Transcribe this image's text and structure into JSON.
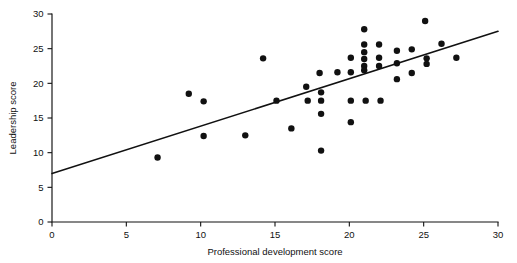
{
  "chart_data": {
    "type": "scatter",
    "title": "",
    "subtitle": "",
    "xlabel": "Professional development score",
    "ylabel": "Leadership score",
    "xlim": [
      0,
      30
    ],
    "ylim": [
      0,
      30
    ],
    "xticks": [
      0,
      5,
      10,
      15,
      20,
      25,
      30
    ],
    "yticks": [
      0,
      5,
      10,
      15,
      20,
      25,
      30
    ],
    "xtick_labels": [
      "0",
      "5",
      "10",
      "15",
      "20",
      "25",
      "30"
    ],
    "ytick_labels": [
      "0",
      "5",
      "10",
      "15",
      "20",
      "25",
      "30"
    ],
    "grid": false,
    "legend": false,
    "legend_position": "none",
    "marker": "filled-circle",
    "marker_color": "#111111",
    "marker_size_px": 3.2,
    "series": [
      {
        "name": "Observations",
        "points": [
          [
            7.1,
            9.3
          ],
          [
            9.2,
            18.5
          ],
          [
            10.2,
            17.4
          ],
          [
            10.2,
            12.4
          ],
          [
            13.0,
            12.5
          ],
          [
            14.2,
            23.6
          ],
          [
            15.1,
            17.5
          ],
          [
            16.1,
            13.5
          ],
          [
            17.1,
            19.5
          ],
          [
            17.2,
            17.5
          ],
          [
            18.0,
            21.5
          ],
          [
            18.1,
            18.7
          ],
          [
            18.1,
            17.5
          ],
          [
            18.1,
            15.6
          ],
          [
            18.1,
            10.3
          ],
          [
            19.2,
            21.6
          ],
          [
            20.1,
            23.7
          ],
          [
            20.1,
            21.6
          ],
          [
            20.1,
            17.5
          ],
          [
            20.1,
            14.4
          ],
          [
            21.0,
            27.8
          ],
          [
            21.0,
            25.6
          ],
          [
            21.0,
            24.5
          ],
          [
            21.0,
            23.5
          ],
          [
            21.0,
            22.5
          ],
          [
            21.0,
            21.9
          ],
          [
            21.1,
            17.5
          ],
          [
            22.0,
            25.6
          ],
          [
            22.0,
            23.7
          ],
          [
            22.0,
            22.5
          ],
          [
            22.1,
            17.5
          ],
          [
            23.2,
            24.7
          ],
          [
            23.2,
            22.9
          ],
          [
            23.2,
            20.6
          ],
          [
            24.2,
            24.9
          ],
          [
            24.2,
            21.5
          ],
          [
            25.1,
            29.0
          ],
          [
            25.2,
            23.6
          ],
          [
            25.2,
            22.8
          ],
          [
            26.2,
            25.7
          ],
          [
            27.2,
            23.7
          ]
        ]
      }
    ],
    "fit_line": {
      "name": "Least-squares regression line",
      "x_start": 0,
      "y_start": 7.0,
      "x_end": 30,
      "y_end": 27.5,
      "slope": 0.683,
      "intercept": 7.0,
      "color": "#111111"
    },
    "axis_color": "#111111",
    "background_color": "#ffffff"
  },
  "geometry": {
    "plot_left_px": 52,
    "plot_right_px": 498,
    "plot_bottom_px": 222,
    "plot_top_px": 14
  }
}
